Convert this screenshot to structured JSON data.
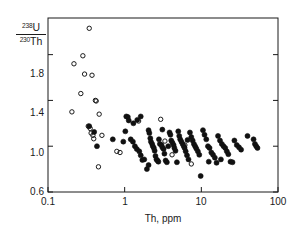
{
  "chart_data": {
    "type": "scatter",
    "title": "",
    "xlabel": "Th, ppm",
    "ylabel_numerator_sup": "238",
    "ylabel_numerator_elem": "U",
    "ylabel_denominator_sup": "230",
    "ylabel_denominator_elem": "Th",
    "xscale": "log",
    "yscale": "linear",
    "xlim": [
      0.1,
      100
    ],
    "ylim": [
      0.6,
      2.12
    ],
    "xticks": [
      "0.1",
      "1",
      "10",
      "100"
    ],
    "xtick_values": [
      0.1,
      1,
      10,
      100
    ],
    "yticks": [
      "0.6",
      "1.0",
      "1.4",
      "1.8"
    ],
    "ytick_values": [
      0.6,
      1.0,
      1.4,
      1.8
    ],
    "grid": false,
    "legend": null,
    "frame": "full-box",
    "series": [
      {
        "name": "open-circles",
        "marker": "open-circle",
        "color": "#1a1a1a",
        "fill": "none",
        "points": [
          [
            0.345,
            2.03
          ],
          [
            0.285,
            1.79
          ],
          [
            0.218,
            1.72
          ],
          [
            0.3,
            1.63
          ],
          [
            0.375,
            1.62
          ],
          [
            0.268,
            1.46
          ],
          [
            0.415,
            1.4
          ],
          [
            0.425,
            1.395
          ],
          [
            0.205,
            1.3
          ],
          [
            0.465,
            1.28
          ],
          [
            0.335,
            1.175
          ],
          [
            0.355,
            1.155
          ],
          [
            0.365,
            1.115
          ],
          [
            0.385,
            1.095
          ],
          [
            0.395,
            1.065
          ],
          [
            0.505,
            1.095
          ],
          [
            0.79,
            0.955
          ],
          [
            0.87,
            0.945
          ],
          [
            0.455,
            0.82
          ],
          [
            1.52,
            1.22
          ],
          [
            2.95,
            1.235
          ],
          [
            3.35,
            1.045
          ],
          [
            4.15,
            0.925
          ],
          [
            7.4,
            0.845
          ],
          [
            6.1,
            1.01
          ]
        ]
      },
      {
        "name": "filled-circles",
        "marker": "filled-circle",
        "color": "#111111",
        "fill": "#111111",
        "points": [
          [
            0.345,
            1.175
          ],
          [
            0.4,
            1.125
          ],
          [
            0.435,
            1.0
          ],
          [
            0.7,
            1.06
          ],
          [
            1.05,
            1.26
          ],
          [
            1.1,
            1.255
          ],
          [
            1.13,
            1.225
          ],
          [
            1.02,
            1.13
          ],
          [
            1.3,
            1.2
          ],
          [
            1.46,
            1.23
          ],
          [
            1.2,
            1.06
          ],
          [
            1.28,
            1.04
          ],
          [
            1.36,
            1.0
          ],
          [
            1.44,
            0.975
          ],
          [
            1.55,
            0.955
          ],
          [
            1.62,
            0.92
          ],
          [
            1.7,
            0.88
          ],
          [
            1.8,
            0.885
          ],
          [
            1.95,
            0.8
          ],
          [
            2.05,
            1.14
          ],
          [
            2.1,
            1.115
          ],
          [
            2.16,
            1.07
          ],
          [
            2.2,
            1.04
          ],
          [
            2.28,
            1.02
          ],
          [
            2.33,
            1.0
          ],
          [
            2.4,
            0.985
          ],
          [
            2.46,
            0.96
          ],
          [
            2.52,
            0.915
          ],
          [
            2.6,
            0.885
          ],
          [
            2.68,
            0.875
          ],
          [
            2.75,
            0.865
          ],
          [
            2.8,
            1.06
          ],
          [
            2.88,
            1.02
          ],
          [
            3.02,
            1.01
          ],
          [
            3.1,
            0.99
          ],
          [
            3.22,
            0.975
          ],
          [
            3.3,
            0.935
          ],
          [
            3.42,
            0.875
          ],
          [
            3.55,
            0.86
          ],
          [
            3.7,
            1.0
          ],
          [
            3.85,
            1.12
          ],
          [
            3.95,
            1.1
          ],
          [
            4.05,
            1.05
          ],
          [
            4.2,
            1.03
          ],
          [
            4.35,
            1.01
          ],
          [
            4.45,
            0.985
          ],
          [
            4.6,
            0.96
          ],
          [
            4.8,
            0.86
          ],
          [
            5.0,
            1.13
          ],
          [
            5.15,
            1.09
          ],
          [
            5.3,
            1.06
          ],
          [
            5.5,
            1.04
          ],
          [
            5.7,
            1.02
          ],
          [
            5.9,
            1.0
          ],
          [
            6.05,
            0.985
          ],
          [
            6.25,
            0.955
          ],
          [
            6.5,
            0.92
          ],
          [
            6.8,
            0.885
          ],
          [
            7.1,
            1.12
          ],
          [
            7.4,
            1.08
          ],
          [
            7.7,
            1.05
          ],
          [
            8.0,
            1.02
          ],
          [
            8.3,
            1.0
          ],
          [
            8.6,
            0.98
          ],
          [
            9.0,
            0.955
          ],
          [
            9.4,
            0.925
          ],
          [
            9.8,
            0.74
          ],
          [
            10.5,
            1.14
          ],
          [
            11.0,
            1.1
          ],
          [
            11.6,
            1.06
          ],
          [
            12.2,
            1.0
          ],
          [
            12.8,
            0.985
          ],
          [
            13.5,
            0.945
          ],
          [
            14.2,
            0.925
          ],
          [
            15.0,
            0.9
          ],
          [
            15.8,
            0.855
          ],
          [
            16.5,
            1.09
          ],
          [
            17.5,
            1.05
          ],
          [
            18.5,
            1.02
          ],
          [
            19.5,
            1.0
          ],
          [
            20.5,
            0.985
          ],
          [
            21.5,
            0.955
          ],
          [
            22.5,
            0.93
          ],
          [
            24.0,
            0.865
          ],
          [
            25.5,
            0.86
          ],
          [
            27.0,
            1.05
          ],
          [
            29.0,
            1.01
          ],
          [
            31.0,
            0.99
          ],
          [
            33.0,
            0.97
          ],
          [
            40.0,
            1.09
          ],
          [
            48.0,
            1.06
          ],
          [
            50.0,
            1.02
          ],
          [
            52.0,
            1.0
          ],
          [
            54.0,
            0.985
          ],
          [
            2.05,
            0.835
          ],
          [
            1.62,
            1.26
          ],
          [
            0.96,
            1.04
          ],
          [
            6.6,
            1.055
          ],
          [
            3.1,
            1.145
          ],
          [
            12.5,
            0.865
          ],
          [
            18.0,
            0.885
          ]
        ]
      }
    ]
  }
}
